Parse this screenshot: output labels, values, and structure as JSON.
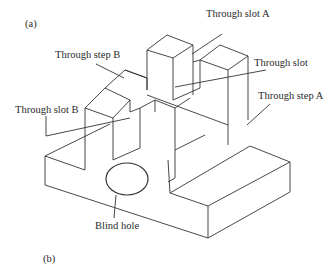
{
  "figure": {
    "panel_a_label": "(a)",
    "panel_b_label": "(b)",
    "labels": {
      "through_slot_a": "Through slot A",
      "through_slot": "Through slot",
      "through_step_a": "Through step A",
      "through_step_b": "Through step B",
      "through_slot_b": "Through slot B",
      "blind_hole": "Blind hole"
    },
    "line_color": "#333333",
    "background": "#ffffff"
  }
}
